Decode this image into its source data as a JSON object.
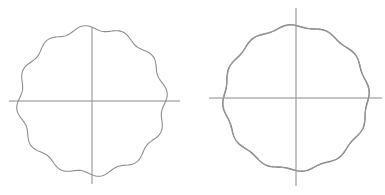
{
  "figures": [
    {
      "name": "single-perturbed-circle",
      "center": [
        92,
        101
      ],
      "radius": 73,
      "lobes": 12,
      "amplitude": 2.6,
      "phase": 0.3,
      "axes": {
        "h": [
          9,
          180,
          101
        ],
        "v": [
          92,
          27,
          184
        ]
      },
      "curves": [
        {
          "color": "#8e8e8e",
          "width": 1.1,
          "amp_scale": 1.0,
          "phase_shift": 0
        }
      ]
    },
    {
      "name": "double-perturbed-circle",
      "center": [
        296,
        98
      ],
      "radius": 72,
      "lobes": 12,
      "amplitude": 1.6,
      "phase": 0.3,
      "axes": {
        "h": [
          209,
          382,
          98
        ],
        "v": [
          296,
          8,
          186
        ]
      },
      "curves": [
        {
          "color": "#6a6a6a",
          "width": 1.1,
          "amp_scale": 1.0,
          "phase_shift": 0
        },
        {
          "color": "#9a9a9a",
          "width": 1.1,
          "amp_scale": 0.8,
          "phase_shift": 0.25
        }
      ]
    }
  ]
}
